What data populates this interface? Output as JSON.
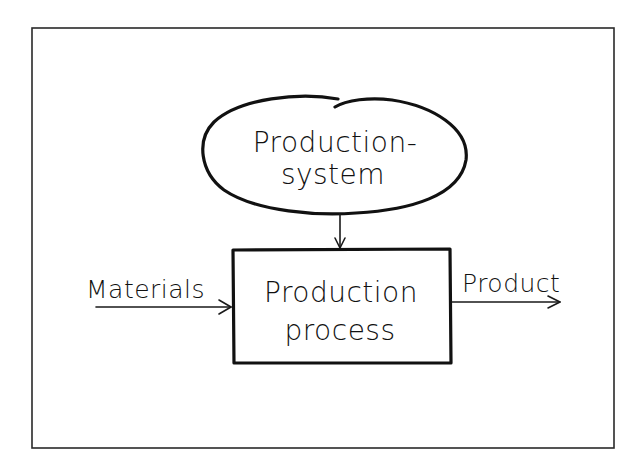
{
  "diagram": {
    "colors": {
      "background": "#ffffff",
      "ink": "#111111",
      "frame": "#2a2a2a"
    },
    "nodes": {
      "system": {
        "shape": "ellipse",
        "line1": "Production-",
        "line2": "system"
      },
      "process": {
        "shape": "rectangle",
        "line1": "Production",
        "line2": "process"
      }
    },
    "edges": [
      {
        "from": "Materials",
        "to": "process",
        "label": "Materials"
      },
      {
        "from": "system",
        "to": "process",
        "label": ""
      },
      {
        "from": "process",
        "to": "Product",
        "label": "Product"
      }
    ],
    "labels": {
      "input": "Materials",
      "output": "Product"
    }
  }
}
